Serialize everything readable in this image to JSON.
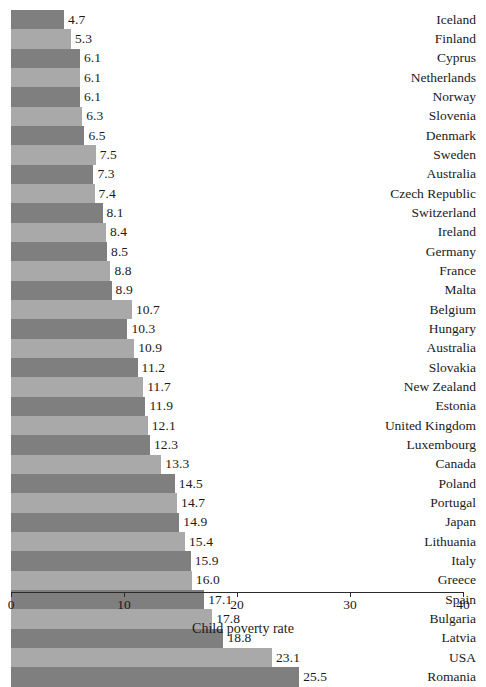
{
  "chart_data": {
    "type": "bar",
    "orientation": "horizontal",
    "title": "",
    "xlabel": "Child poverty rate",
    "ylabel": "",
    "xlim": [
      0,
      40
    ],
    "xticks": [
      0,
      10,
      20,
      30,
      40
    ],
    "xtick_labels": [
      "0",
      "10",
      "20",
      "30",
      "40"
    ],
    "grid": false,
    "legend": false,
    "bar_colors": [
      "#7f7f7f",
      "#a9a9a9"
    ],
    "categories": [
      "Iceland",
      "Finland",
      "Cyprus",
      "Netherlands",
      "Norway",
      "Slovenia",
      "Denmark",
      "Sweden",
      "Australia",
      "Czech Republic",
      "Switzerland",
      "Ireland",
      "Germany",
      "France",
      "Malta",
      "Belgium",
      "Hungary",
      "Australia",
      "Slovakia",
      "New Zealand",
      "Estonia",
      "United Kingdom",
      "Luxembourg",
      "Canada",
      "Poland",
      "Portugal",
      "Japan",
      "Lithuania",
      "Italy",
      "Greece",
      "Spain",
      "Bulgaria",
      "Latvia",
      "USA",
      "Romania"
    ],
    "values": [
      4.7,
      5.3,
      6.1,
      6.1,
      6.1,
      6.3,
      6.5,
      7.5,
      7.3,
      7.4,
      8.1,
      8.4,
      8.5,
      8.8,
      8.9,
      10.7,
      10.3,
      10.9,
      11.2,
      11.7,
      11.9,
      12.1,
      12.3,
      13.3,
      14.5,
      14.7,
      14.9,
      15.4,
      15.9,
      16.0,
      17.1,
      17.8,
      18.8,
      23.1,
      25.5
    ],
    "value_labels": [
      "4.7",
      "5.3",
      "6.1",
      "6.1",
      "6.1",
      "6.3",
      "6.5",
      "7.5",
      "7.3",
      "7.4",
      "8.1",
      "8.4",
      "8.5",
      "8.8",
      "8.9",
      "10.7",
      "10.3",
      "10.9",
      "11.2",
      "11.7",
      "11.9",
      "12.1",
      "12.3",
      "13.3",
      "14.5",
      "14.7",
      "14.9",
      "15.4",
      "15.9",
      "16.0",
      "17.1",
      "17.8",
      "18.8",
      "23.1",
      "25.5"
    ]
  }
}
